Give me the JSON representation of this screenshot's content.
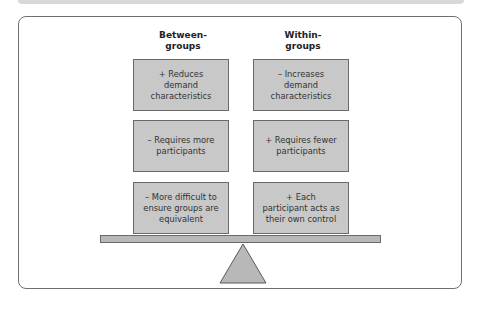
{
  "diagram": {
    "type": "balance-scale",
    "columns": [
      {
        "header": "Between-\ngroups",
        "header_line1": "Between-",
        "header_line2": "groups",
        "items": [
          {
            "sign": "+",
            "text": "+ Reduces demand characteristics",
            "lines": [
              "+ Reduces",
              "demand",
              "characteristics"
            ]
          },
          {
            "sign": "–",
            "text": "– Requires more participants",
            "lines": [
              "– Requires more",
              "participants"
            ]
          },
          {
            "sign": "–",
            "text": "– More difficult to ensure groups are equivalent",
            "lines": [
              "– More difficult to",
              "ensure groups are",
              "equivalent"
            ]
          }
        ]
      },
      {
        "header": "Within-\ngroups",
        "header_line1": "Within-",
        "header_line2": "groups",
        "items": [
          {
            "sign": "–",
            "text": "– Increases demand characteristics",
            "lines": [
              "– Increases",
              "demand",
              "characteristics"
            ]
          },
          {
            "sign": "+",
            "text": "+ Requires fewer participants",
            "lines": [
              "+ Requires fewer",
              "participants"
            ]
          },
          {
            "sign": "+",
            "text": "+ Each participant acts as their own control",
            "lines": [
              "+ Each",
              "participant acts as",
              "their own control"
            ]
          }
        ]
      }
    ],
    "colors": {
      "box_fill": "#c8c8c8",
      "box_border": "#6a6a6a",
      "beam_fill": "#b8b8b8",
      "fulcrum_fill": "#b8b8b8",
      "frame_border": "#6f6f6f"
    }
  }
}
